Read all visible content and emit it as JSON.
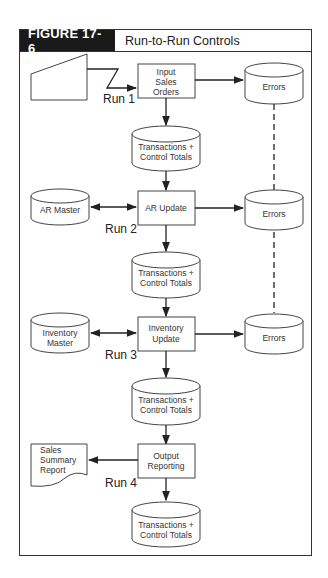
{
  "figure": {
    "label": "FIGURE 17-6",
    "title": "Run-to-Run Controls",
    "accent_color": "#1a1a1a"
  },
  "diagram": {
    "runs": [
      "Run 1",
      "Run 2",
      "Run 3",
      "Run 4"
    ],
    "processes": {
      "input_sales_orders": [
        "Input",
        "Sales",
        "Orders"
      ],
      "ar_update": [
        "AR Update"
      ],
      "inventory_update": [
        "Inventory",
        "Update"
      ],
      "output_reporting": [
        "Output",
        "Reporting"
      ]
    },
    "storage": {
      "errors_1": [
        "Errors"
      ],
      "errors_2": [
        "Errors"
      ],
      "errors_3": [
        "Errors"
      ],
      "transactions_1": [
        "Transactions +",
        "Control Totals"
      ],
      "transactions_2": [
        "Transactions +",
        "Control Totals"
      ],
      "transactions_3": [
        "Transactions +",
        "Control Totals"
      ],
      "transactions_4": [
        "Transactions +",
        "Control Totals"
      ],
      "ar_master": [
        "AR Master"
      ],
      "inventory_master": [
        "Inventory",
        "Master"
      ]
    },
    "documents": {
      "sales_summary_report": [
        "Sales",
        "Summary",
        "Report"
      ]
    },
    "connections": [
      {
        "from": "manual-input",
        "to": "Input Sales Orders",
        "type": "communication-link"
      },
      {
        "from": "Input Sales Orders",
        "to": "Errors",
        "type": "arrow"
      },
      {
        "from": "Input Sales Orders",
        "to": "Transactions + Control Totals (1)",
        "type": "arrow"
      },
      {
        "from": "Transactions + Control Totals (1)",
        "to": "AR Update",
        "type": "arrow"
      },
      {
        "from": "AR Master",
        "to": "AR Update",
        "type": "bidirectional"
      },
      {
        "from": "AR Update",
        "to": "Errors",
        "type": "arrow"
      },
      {
        "from": "AR Update",
        "to": "Transactions + Control Totals (2)",
        "type": "arrow"
      },
      {
        "from": "Transactions + Control Totals (2)",
        "to": "Inventory Update",
        "type": "arrow"
      },
      {
        "from": "Inventory Master",
        "to": "Inventory Update",
        "type": "bidirectional"
      },
      {
        "from": "Inventory Update",
        "to": "Errors",
        "type": "arrow"
      },
      {
        "from": "Inventory Update",
        "to": "Transactions + Control Totals (3)",
        "type": "arrow"
      },
      {
        "from": "Transactions + Control Totals (3)",
        "to": "Output Reporting",
        "type": "arrow"
      },
      {
        "from": "Output Reporting",
        "to": "Sales Summary Report",
        "type": "arrow"
      },
      {
        "from": "Output Reporting",
        "to": "Transactions + Control Totals (4)",
        "type": "arrow"
      },
      {
        "from": "Errors",
        "to": "Errors",
        "type": "dashed"
      }
    ]
  }
}
